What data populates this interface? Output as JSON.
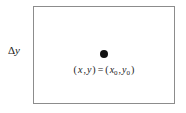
{
  "figure": {
    "name": "rectangular-region-with-marked-point",
    "background_color": "#ffffff",
    "box": {
      "stroke_color": "#8c8c8c",
      "fill_color": "#ffffff"
    },
    "labels": {
      "delta_y_symbol": "Δ",
      "delta_y_variable": "y",
      "delta_y_full": "Δy"
    },
    "point": {
      "color": "#121212",
      "equation_open_left": "(",
      "equation_var_x": "x",
      "equation_comma_1": ",",
      "equation_var_y": "y",
      "equation_close_left": ")",
      "equation_equals": "=",
      "equation_open_right": "(",
      "equation_var_x0": "x",
      "equation_sub_x0": "0",
      "equation_comma_2": ",",
      "equation_var_y0": "y",
      "equation_sub_y0": "0",
      "equation_close_right": ")",
      "equation_full": "(x,y) = (x0,y0)"
    }
  }
}
